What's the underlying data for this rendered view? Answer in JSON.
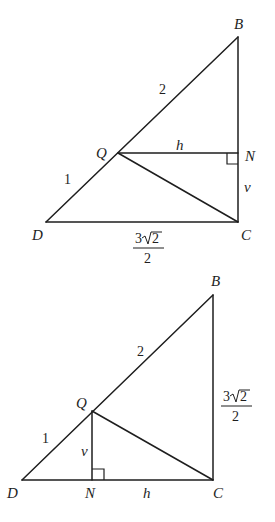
{
  "diagrams": [
    {
      "id": "top",
      "points": {
        "B": {
          "label": "B",
          "x": 238,
          "y": 37
        },
        "Q": {
          "label": "Q",
          "x": 118,
          "y": 153
        },
        "N": {
          "label": "N",
          "x": 238,
          "y": 153
        },
        "D": {
          "label": "D",
          "x": 46,
          "y": 222
        },
        "C": {
          "label": "C",
          "x": 238,
          "y": 222
        }
      },
      "segment_labels": {
        "QB": "2",
        "DQ": "1",
        "QN": "h",
        "NC": "v",
        "DC_numerator_coef": "3",
        "DC_numerator_radicand": "2",
        "DC_denominator": "2"
      },
      "right_angle_at": "N"
    },
    {
      "id": "bottom",
      "points": {
        "B": {
          "label": "B",
          "x": 213,
          "y": 295
        },
        "Q": {
          "label": "Q",
          "x": 92,
          "y": 411
        },
        "N": {
          "label": "N",
          "x": 92,
          "y": 480
        },
        "D": {
          "label": "D",
          "x": 22,
          "y": 480
        },
        "C": {
          "label": "C",
          "x": 213,
          "y": 480
        }
      },
      "segment_labels": {
        "QB": "2",
        "DQ": "1",
        "QN": "v",
        "NC": "h",
        "BC_numerator_coef": "3",
        "BC_numerator_radicand": "2",
        "BC_denominator": "2"
      },
      "right_angle_at": "N"
    }
  ]
}
